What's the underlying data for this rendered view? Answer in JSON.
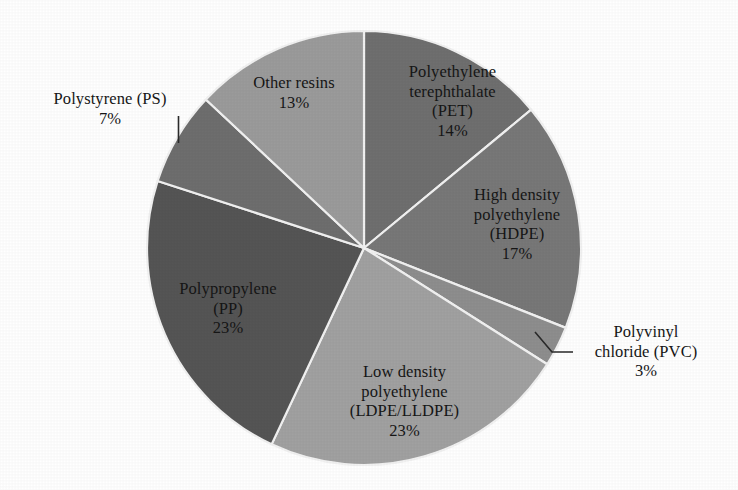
{
  "chart_data": {
    "type": "pie",
    "title": "",
    "subtitle": "",
    "xlabel": "",
    "ylabel": "",
    "legend_position": "none",
    "grid": false,
    "units": "percent",
    "start_angle_deg": 0,
    "direction": "clockwise",
    "categories": [
      "Polyethylene terephthalate (PET)",
      "High density polyethylene (HDPE)",
      "Polyvinyl chloride (PVC)",
      "Low density polyethylene (LDPE/LLDPE)",
      "Polypropylene (PP)",
      "Polystyrene (PS)",
      "Other resins"
    ],
    "values": [
      14,
      17,
      3,
      23,
      23,
      7,
      13
    ],
    "slices": [
      {
        "id": "pet",
        "name": "Polyethylene terephthalate (PET)",
        "value": 14,
        "percent_label": "14%",
        "color": "#6f6f6f",
        "label_lines": [
          "Polyethylene",
          "terephthalate",
          "(PET)"
        ],
        "label_inside": true,
        "leader_line": false
      },
      {
        "id": "hdpe",
        "name": "High density polyethylene (HDPE)",
        "value": 17,
        "percent_label": "17%",
        "color": "#787878",
        "label_lines": [
          "High density",
          "polyethylene",
          "(HDPE)"
        ],
        "label_inside": true,
        "leader_line": false
      },
      {
        "id": "pvc",
        "name": "Polyvinyl chloride (PVC)",
        "value": 3,
        "percent_label": "3%",
        "color": "#8e8e8e",
        "label_lines": [
          "Polyvinyl",
          "chloride (PVC)"
        ],
        "label_inside": false,
        "leader_line": true
      },
      {
        "id": "ldpe",
        "name": "Low density polyethylene (LDPE/LLDPE)",
        "value": 23,
        "percent_label": "23%",
        "color": "#a1a1a1",
        "label_lines": [
          "Low density",
          "polyethylene",
          "(LDPE/LLDPE)"
        ],
        "label_inside": true,
        "leader_line": false
      },
      {
        "id": "pp",
        "name": "Polypropylene (PP)",
        "value": 23,
        "percent_label": "23%",
        "color": "#555555",
        "label_lines": [
          "Polypropylene",
          "(PP)"
        ],
        "label_inside": true,
        "leader_line": false
      },
      {
        "id": "ps",
        "name": "Polystyrene (PS)",
        "value": 7,
        "percent_label": "7%",
        "color": "#6e6e6e",
        "label_lines": [
          "Polystyrene (PS)"
        ],
        "label_inside": false,
        "leader_line": true
      },
      {
        "id": "other",
        "name": "Other resins",
        "value": 13,
        "percent_label": "13%",
        "color": "#9b9b9b",
        "label_lines": [
          "Other resins"
        ],
        "label_inside": true,
        "leader_line": false
      }
    ]
  },
  "labels": {
    "pet": {
      "line1": "Polyethylene",
      "line2": "terephthalate",
      "line3": "(PET)",
      "pct": "14%"
    },
    "hdpe": {
      "line1": "High density",
      "line2": "polyethylene",
      "line3": "(HDPE)",
      "pct": "17%"
    },
    "pvc": {
      "line1": "Polyvinyl",
      "line2": "chloride (PVC)",
      "pct": "3%"
    },
    "ldpe": {
      "line1": "Low density",
      "line2": "polyethylene",
      "line3": "(LDPE/LLDPE)",
      "pct": "23%"
    },
    "pp": {
      "line1": "Polypropylene",
      "line2": "(PP)",
      "pct": "23%"
    },
    "ps": {
      "line1": "Polystyrene (PS)",
      "pct": "7%"
    },
    "other": {
      "line1": "Other resins",
      "pct": "13%"
    }
  },
  "geometry": {
    "center_x": 364,
    "center_y": 248,
    "radius": 217
  },
  "colors": {
    "background": "#ffffff",
    "separator": "#f2f2f2",
    "text": "#161616"
  }
}
